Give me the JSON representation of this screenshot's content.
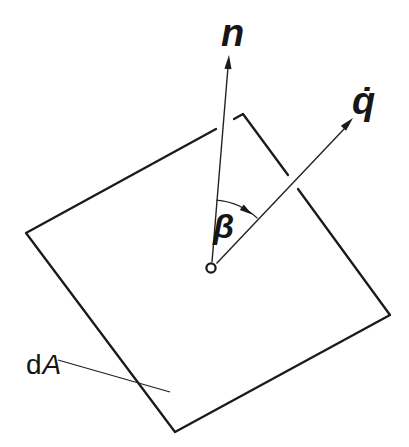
{
  "diagram": {
    "background_color": "#ffffff",
    "outline_color": "#1a1a1a",
    "vector_color": "#222222",
    "labels": {
      "normal_vector": "n",
      "flux_vector": "q̇",
      "angle": "β",
      "area_element_d": "d",
      "area_element_A": "A"
    }
  }
}
